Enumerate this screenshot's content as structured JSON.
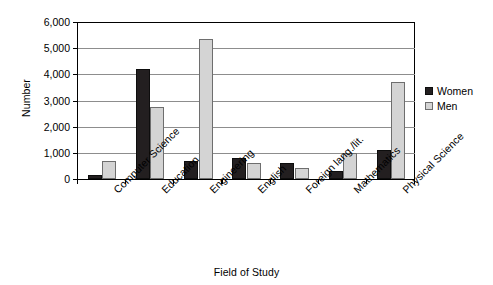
{
  "chart_data": {
    "type": "bar",
    "title": "",
    "xlabel": "Field of Study",
    "ylabel": "Number",
    "ylim": [
      0,
      6000
    ],
    "ytick_step": 1000,
    "ytick_labels": [
      "6,000",
      "5,000",
      "4,000",
      "3,000",
      "2,000",
      "1,000",
      "0"
    ],
    "ytick_values": [
      6000,
      5000,
      4000,
      3000,
      2000,
      1000,
      0
    ],
    "grid": true,
    "legend_position": "right",
    "categories": [
      "Computer Science",
      "Education",
      "Engineering",
      "English",
      "Foreign lang./lit.",
      "Mathematics",
      "Physical Science"
    ],
    "series": [
      {
        "name": "Women",
        "color": "#231f20",
        "values": [
          150,
          4200,
          700,
          820,
          600,
          300,
          1100
        ]
      },
      {
        "name": "Men",
        "color": "#d4d4d4",
        "values": [
          700,
          2750,
          5350,
          620,
          430,
          1000,
          3700
        ]
      }
    ]
  },
  "legend": {
    "items": [
      {
        "label": "Women",
        "swatch": "black-square-swatch"
      },
      {
        "label": "Men",
        "swatch": "gray-square-swatch"
      }
    ]
  }
}
